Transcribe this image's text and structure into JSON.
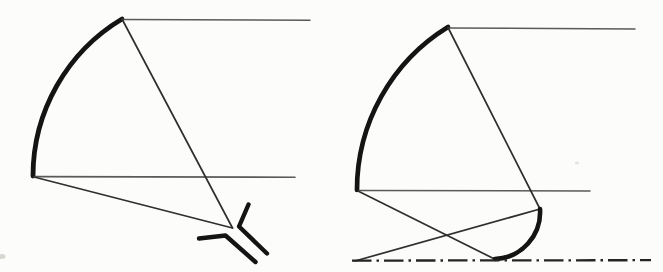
{
  "page": {
    "background": "#fcfcfa",
    "ink": "#161616",
    "ray_ink": "#2f2f2f",
    "scan_ink": "#4c4c4c"
  },
  "figure": {
    "viewbox": "0 0 663 272",
    "width": 663,
    "height": 272,
    "diagrams": [
      {
        "name": "herschelian-telescope-diagram",
        "elements": [
          {
            "type": "path",
            "role": "primary-mirror-arc",
            "d": "M 122 19 A 183 183 0 0 0 33 176",
            "stroke": "#141414",
            "width": 4.8
          },
          {
            "type": "line",
            "role": "incoming-ray-top",
            "x1": 122,
            "y1": 19.5,
            "x2": 310,
            "y2": 20.2,
            "stroke": "#4c4c4c",
            "width": 1.5,
            "opacity": 0.92
          },
          {
            "type": "line",
            "role": "incoming-ray-bottom",
            "x1": 34,
            "y1": 176.6,
            "x2": 295,
            "y2": 177.2,
            "stroke": "#4c4c4c",
            "width": 1.6,
            "opacity": 0.92
          },
          {
            "type": "line",
            "role": "reflected-ray-upper",
            "x1": 122,
            "y1": 19,
            "x2": 232.5,
            "y2": 228,
            "stroke": "#2f2f2f",
            "width": 1.7
          },
          {
            "type": "line",
            "role": "reflected-ray-lower",
            "x1": 34,
            "y1": 177,
            "x2": 232.5,
            "y2": 228,
            "stroke": "#2f2f2f",
            "width": 1.7
          },
          {
            "type": "polyline",
            "role": "eyepiece-mark-upper",
            "points": "248.5,204.5 239,226.5 267,253.5",
            "stroke": "#141414",
            "width": 4.4
          },
          {
            "type": "polyline",
            "role": "eyepiece-mark-lower",
            "points": "199,238.5 225.5,235.5 255.5,262",
            "stroke": "#141414",
            "width": 4.4
          }
        ]
      },
      {
        "name": "brachymedial-telescope-diagram",
        "elements": [
          {
            "type": "path",
            "role": "primary-mirror-arc",
            "d": "M 448 27 A 191 191 0 0 0 357 190",
            "stroke": "#141414",
            "width": 4.7
          },
          {
            "type": "line",
            "role": "incoming-ray-top",
            "x1": 448,
            "y1": 28,
            "x2": 635,
            "y2": 29,
            "stroke": "#4c4c4c",
            "width": 1.5,
            "opacity": 0.92
          },
          {
            "type": "line",
            "role": "incoming-ray-middle",
            "x1": 359,
            "y1": 190.6,
            "x2": 590,
            "y2": 191,
            "stroke": "#4c4c4c",
            "width": 1.5,
            "opacity": 0.92
          },
          {
            "type": "line",
            "role": "converging-ray-upper",
            "x1": 448,
            "y1": 27.5,
            "x2": 540,
            "y2": 209,
            "stroke": "#2f2f2f",
            "width": 1.7
          },
          {
            "type": "line",
            "role": "converging-ray-lower",
            "x1": 358,
            "y1": 191,
            "x2": 494.5,
            "y2": 259,
            "stroke": "#2f2f2f",
            "width": 1.7
          },
          {
            "type": "line",
            "role": "secondary-reflected-ray",
            "x1": 540,
            "y1": 209,
            "x2": 355,
            "y2": 261,
            "stroke": "#2f2f2f",
            "width": 1.7
          },
          {
            "type": "path",
            "role": "secondary-mirror-arc",
            "d": "M 540 209 A 47 47 0 0 1 495 259",
            "stroke": "#141414",
            "width": 4.6
          },
          {
            "type": "line",
            "role": "optical-axis-dash-dot",
            "x1": 352,
            "y1": 260.6,
            "x2": 651,
            "y2": 260.2,
            "stroke": "#242424",
            "width": 2.3,
            "dash": "19.5 5 2.5 5",
            "cap": "butt"
          }
        ]
      }
    ],
    "artifacts": [
      {
        "role": "scan-speck",
        "x": 2,
        "y": 256.5,
        "rx": 3.5,
        "ry": 2.5,
        "fill": "#b9b9b3",
        "opacity": 0.55
      },
      {
        "role": "scan-speck",
        "x": 577,
        "y": 163,
        "rx": 2.2,
        "ry": 1.6,
        "fill": "#c7c7c1",
        "opacity": 0.45
      }
    ]
  }
}
